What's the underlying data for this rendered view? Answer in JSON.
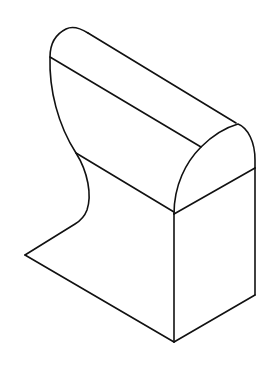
{
  "figure": {
    "description": "Isometric line drawing of an extruded solid with a rounded top and curved (S-shaped) left profile, resembling a rail section or anvil block",
    "background_color": "#ffffff",
    "stroke_color": "#111111",
    "views": [
      "isometric"
    ]
  },
  "shape": {
    "faces": [
      {
        "name": "rounded-top-face",
        "type": "curved"
      },
      {
        "name": "upper-left-face",
        "type": "planar"
      },
      {
        "name": "lower-left-face",
        "type": "planar"
      },
      {
        "name": "front-profile-face",
        "type": "planar"
      },
      {
        "name": "right-face",
        "type": "planar"
      }
    ],
    "vertices": {
      "top_apex": [
        73,
        28
      ],
      "upper_left_corner": [
        50,
        57
      ],
      "ridge_back": [
        88,
        32
      ],
      "ridge_front": [
        238,
        124
      ],
      "top_edge_front": [
        201,
        147
      ],
      "mid_left": [
        76,
        153
      ],
      "mid_front": [
        174,
        212
      ],
      "right_mid": [
        255,
        168
      ],
      "s_curve_bottom": [
        78,
        222
      ],
      "left_vertex": [
        25,
        255
      ],
      "bottom_vertex": [
        174,
        342
      ],
      "bottom_right": [
        255,
        295
      ]
    }
  }
}
